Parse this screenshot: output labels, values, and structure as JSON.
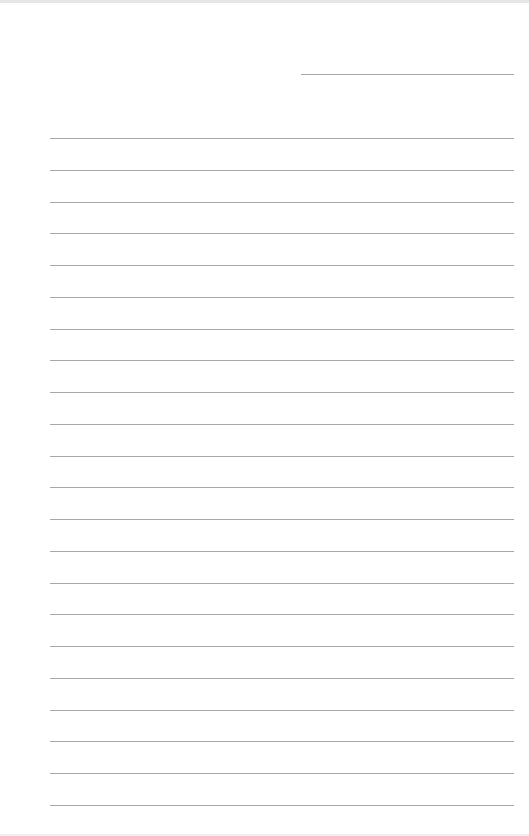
{
  "page": {
    "type": "lined-paper",
    "background": "#ffffff",
    "line_color": "#8a8a8a",
    "header_line": {
      "x": 301,
      "y": 74,
      "width": 213
    },
    "ruled_lines": {
      "count": 22,
      "x": 50,
      "width": 464,
      "first_y": 138,
      "spacing": 31.76
    }
  }
}
